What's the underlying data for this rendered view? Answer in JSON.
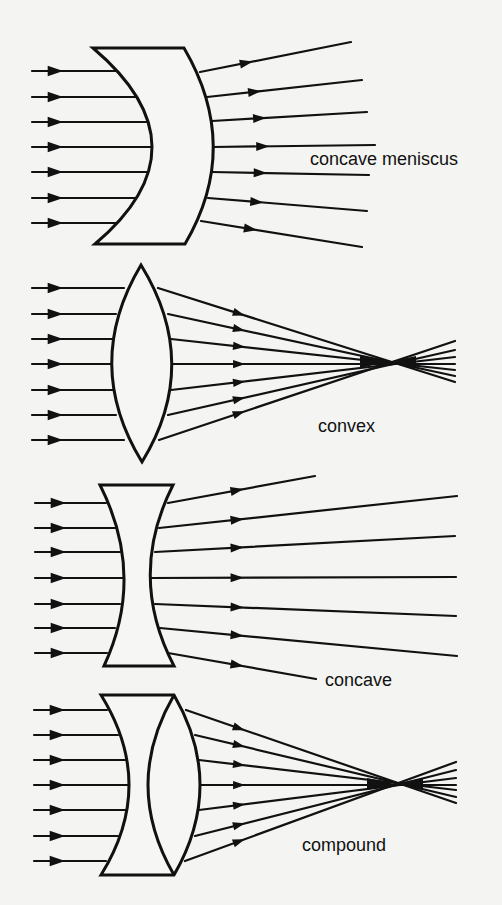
{
  "colors": {
    "ink": "#111111",
    "background": "#f4f4f2",
    "lens_fill": "#f6f6f4"
  },
  "icons": {
    "arrowhead": "arrowhead-icon"
  },
  "panels": [
    {
      "id": "concave-meniscus",
      "label": "concave meniscus",
      "label_pos": [
        310,
        165
      ],
      "lens_path": "M93,48 L184,48 Q242,147 185,244 L95,244 Q210,147 93,48 Z",
      "inner_path": "",
      "incoming_rays_y": [
        71,
        97,
        122,
        147,
        172,
        198,
        223
      ],
      "incoming_start_x": 32,
      "incoming_end_x": [
        118,
        137,
        148,
        152,
        149,
        137,
        117
      ],
      "outgoing": [
        [
          200,
          72,
          351,
          42
        ],
        [
          207,
          97,
          362,
          80
        ],
        [
          212,
          121,
          367,
          112
        ],
        [
          213,
          147,
          375,
          145
        ],
        [
          212,
          172,
          369,
          175
        ],
        [
          208,
          198,
          367,
          211
        ],
        [
          201,
          221,
          362,
          247
        ]
      ],
      "mid_arrow_t": 0.3
    },
    {
      "id": "convex",
      "label": "convex",
      "label_pos": [
        318,
        432
      ],
      "lens_path": "M141,265 Q82,364 142,462 Q202,364 141,265 Z",
      "inner_path": "",
      "incoming_rays_y": [
        288,
        314,
        339,
        364,
        390,
        415,
        440
      ],
      "incoming_start_x": 32,
      "incoming_end_x": [
        124,
        116,
        113,
        112,
        113,
        116,
        124
      ],
      "outgoing": [
        [
          158,
          288,
          455,
          382
        ],
        [
          168,
          314,
          455,
          376
        ],
        [
          171,
          339,
          455,
          370
        ],
        [
          172,
          364,
          455,
          364
        ],
        [
          171,
          390,
          455,
          357
        ],
        [
          168,
          415,
          455,
          350
        ],
        [
          159,
          440,
          455,
          341
        ]
      ],
      "focal_point": [
        388,
        362
      ],
      "mid_arrow_x": 238
    },
    {
      "id": "concave",
      "label": "concave",
      "label_pos": [
        325,
        686
      ],
      "lens_path": "M100,485 L173,485 Q127,576 174,666 L104,666 Q146,576 100,485 Z",
      "inner_path": "",
      "incoming_rays_y": [
        503,
        528,
        552,
        578,
        604,
        628,
        653
      ],
      "incoming_start_x": 35,
      "incoming_end_x": [
        106,
        115,
        120,
        123,
        120,
        115,
        107
      ],
      "outgoing": [
        [
          168,
          503,
          315,
          476
        ],
        [
          159,
          528,
          457,
          496
        ],
        [
          155,
          552,
          455,
          536
        ],
        [
          151,
          578,
          456,
          577
        ],
        [
          155,
          604,
          456,
          616
        ],
        [
          160,
          628,
          457,
          656
        ],
        [
          168,
          653,
          316,
          679
        ]
      ],
      "mid_arrow_x": 236
    },
    {
      "id": "compound",
      "label": "compound",
      "label_pos": [
        302,
        851
      ],
      "lens_path": "M101,695 L174,695 Q226,785 174,875 L101,875 Q157,785 101,695 Z",
      "inner_path": "M174,695 Q122,785 174,875",
      "incoming_rays_y": [
        710,
        735,
        760,
        785,
        810,
        836,
        861
      ],
      "incoming_start_x": 34,
      "incoming_end_x": [
        107,
        118,
        126,
        129,
        126,
        118,
        106
      ],
      "outgoing": [
        [
          186,
          710,
          456,
          803
        ],
        [
          195,
          735,
          456,
          797
        ],
        [
          199,
          760,
          456,
          790
        ],
        [
          200,
          785,
          456,
          785
        ],
        [
          199,
          810,
          456,
          778
        ],
        [
          195,
          836,
          456,
          770
        ],
        [
          185,
          861,
          456,
          762
        ]
      ],
      "focal_point": [
        395,
        784
      ],
      "mid_arrow_x": 238
    }
  ]
}
